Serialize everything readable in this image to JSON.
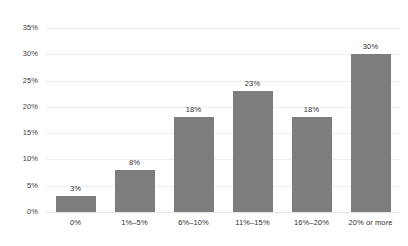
{
  "chart_data": {
    "type": "bar",
    "title": "",
    "subtitle": "",
    "xlabel": "",
    "ylabel": "",
    "categories": [
      "0%",
      "1%–5%",
      "6%–10%",
      "11%–15%",
      "16%–20%",
      "20% or more"
    ],
    "values": [
      3,
      8,
      18,
      23,
      18,
      30
    ],
    "value_labels": [
      "3%",
      "8%",
      "18%",
      "23%",
      "18%",
      "30%"
    ],
    "ylim": [
      0,
      35
    ],
    "ytick_values": [
      0,
      5,
      10,
      15,
      20,
      25,
      30,
      35
    ],
    "ytick_labels": [
      "0%",
      "5%",
      "10%",
      "15%",
      "20%",
      "25%",
      "30%",
      "35%"
    ],
    "grid": true,
    "grid_axis": "y",
    "legend": false,
    "legend_position": "none",
    "bar_color": "#7d7d7d",
    "gridline_color": "#eceef0",
    "background_color": "#ffffff",
    "text_color": "#2f2f2f"
  }
}
